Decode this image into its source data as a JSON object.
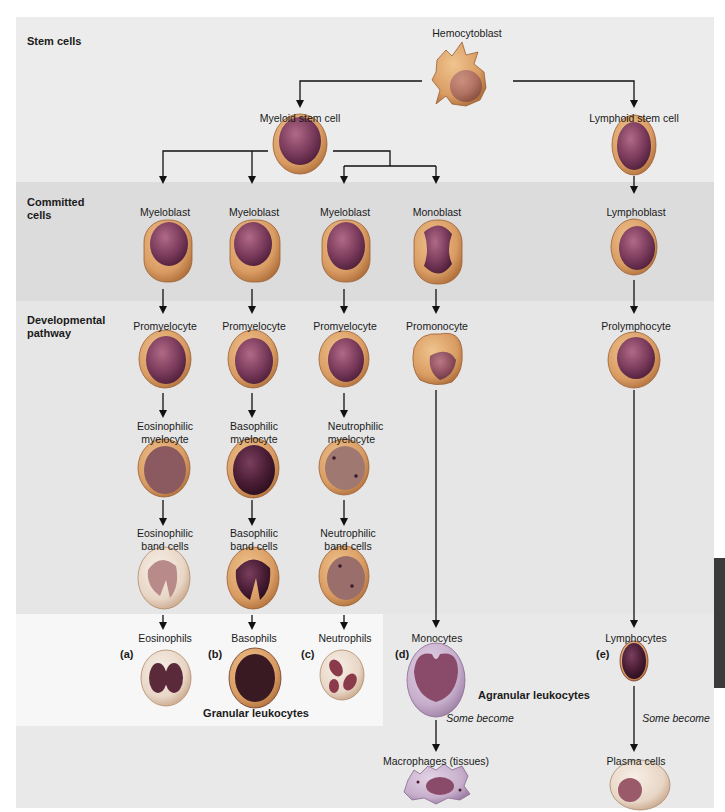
{
  "sections": {
    "stem": "Stem cells",
    "committed": "Committed\ncells",
    "committed_l1": "Committed",
    "committed_l2": "cells",
    "developmental_l1": "Developmental",
    "developmental_l2": "pathway"
  },
  "nodes": {
    "hemocytoblast": "Hemocytoblast",
    "myeloid_stem": "Myeloid stem cell",
    "lymphoid_stem": "Lymphoid stem cell",
    "myeloblast_1": "Myeloblast",
    "myeloblast_2": "Myeloblast",
    "myeloblast_3": "Myeloblast",
    "monoblast": "Monoblast",
    "lymphoblast": "Lymphoblast",
    "promyelocyte_1": "Promyelocyte",
    "promyelocyte_2": "Promyelocyte",
    "promyelocyte_3": "Promyelocyte",
    "promonocyte": "Promonocyte",
    "prolymphocyte": "Prolymphocyte",
    "eos_myelocyte_l1": "Eosinophilic",
    "eos_myelocyte_l2": "myelocyte",
    "baso_myelocyte_l1": "Basophilic",
    "baso_myelocyte_l2": "myelocyte",
    "neut_myelocyte_l1": "Neutrophilic",
    "neut_myelocyte_l2": "myelocyte",
    "eos_band_l1": "Eosinophilic",
    "eos_band_l2": "band cells",
    "baso_band_l1": "Basophilic",
    "baso_band_l2": "band cells",
    "neut_band_l1": "Neutrophilic",
    "neut_band_l2": "band cells",
    "eosinophils": "Eosinophils",
    "basophils": "Basophils",
    "neutrophils": "Neutrophils",
    "monocytes": "Monocytes",
    "lymphocytes": "Lymphocytes",
    "macrophages": "Macrophages (tissues)",
    "plasma_cells": "Plasma cells"
  },
  "letters": {
    "a": "(a)",
    "b": "(b)",
    "c": "(c)",
    "d": "(d)",
    "e": "(e)"
  },
  "groups": {
    "granular": "Granular leukocytes",
    "agranular": "Agranular leukocytes"
  },
  "annotations": {
    "some_become_1": "Some become",
    "some_become_2": "Some become"
  },
  "colors": {
    "cytoplasm": "#d99c63",
    "cytoplasm_edge": "#b8743c",
    "nucleus": "#7b3b5c",
    "nucleus_dark": "#4e1f3a",
    "stem_band": "#ececec",
    "committed_band": "#dcdcdc",
    "dev_band": "#e6e6e6"
  }
}
